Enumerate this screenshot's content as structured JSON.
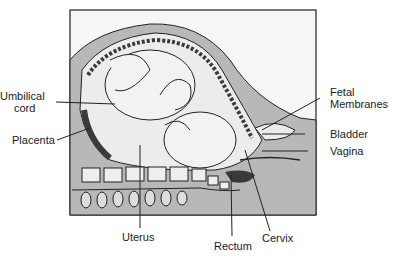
{
  "diagram": {
    "labels": {
      "umbilical_cord_1": "Umbilical",
      "umbilical_cord_2": "cord",
      "placenta": "Placenta",
      "fetal_membranes_1": "Fetal",
      "fetal_membranes_2": "Membranes",
      "bladder": "Bladder",
      "vagina": "Vagina",
      "uterus": "Uterus",
      "rectum": "Rectum",
      "cervix": "Cervix"
    },
    "colors": {
      "outline": "#222222",
      "tissue_gray": "#b8b8b8",
      "light_fill": "#ececec",
      "dark_fill": "#3a3a3a"
    }
  }
}
